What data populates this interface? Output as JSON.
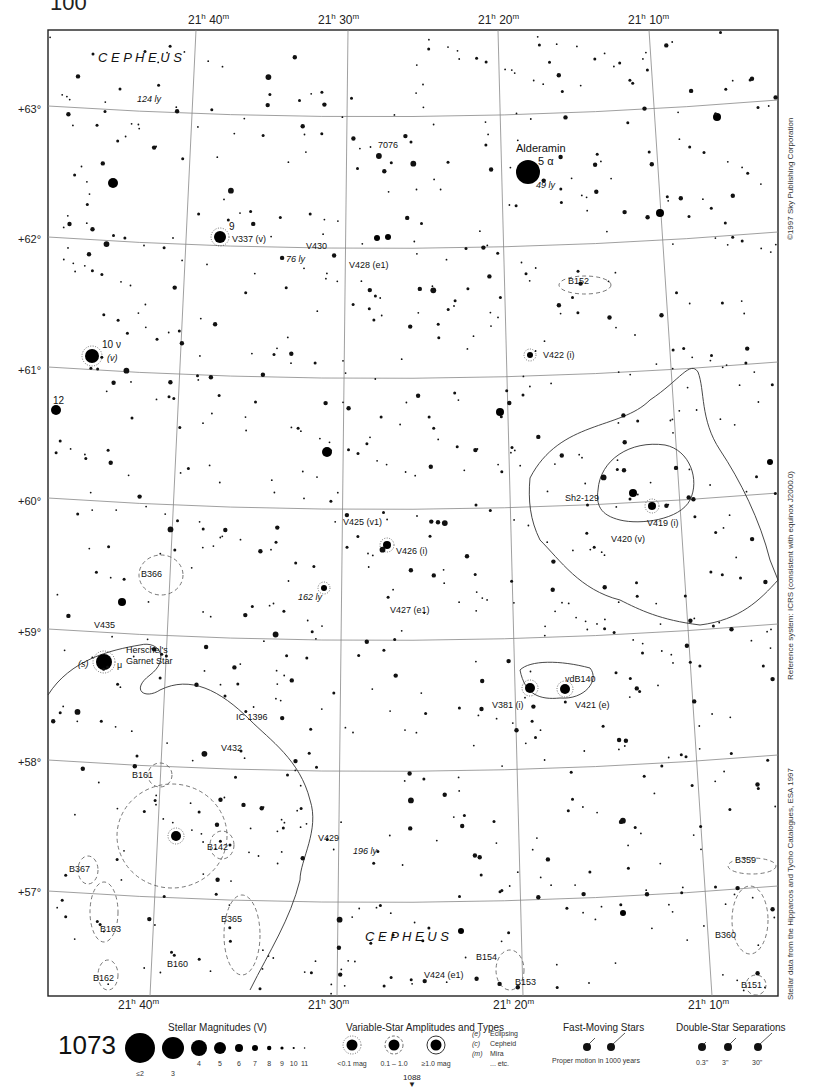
{
  "page": {
    "top_cut_number": "100",
    "page_number": "1073",
    "next_page_ref": "1088"
  },
  "chart": {
    "constellation_label": "C E P H E U S",
    "ra_labels_top": [
      {
        "h": "21",
        "m": "40",
        "x": 210
      },
      {
        "h": "21",
        "m": "30",
        "x": 340
      },
      {
        "h": "21",
        "m": "20",
        "x": 500
      },
      {
        "h": "21",
        "m": "10",
        "x": 650
      }
    ],
    "ra_labels_bottom": [
      {
        "h": "21",
        "m": "40",
        "x": 140
      },
      {
        "h": "21",
        "m": "30",
        "x": 330
      },
      {
        "h": "21",
        "m": "20",
        "x": 515
      },
      {
        "h": "21",
        "m": "10",
        "x": 710
      }
    ],
    "dec_labels": [
      {
        "text": "+63°",
        "y": 110
      },
      {
        "text": "+62°",
        "y": 240
      },
      {
        "text": "+61°",
        "y": 371
      },
      {
        "text": "+60°",
        "y": 502
      },
      {
        "text": "+59°",
        "y": 633
      },
      {
        "text": "+58°",
        "y": 763
      },
      {
        "text": "+57°",
        "y": 893
      }
    ],
    "side_texts": {
      "copyright": "©1997 Sky Publishing Corporation",
      "reference": "Reference system: ICRS (consistent with equinox J2000.0)",
      "stellar_data": "Stellar data from the Hipparcos and Tycho Catalogues, ESA 1997"
    },
    "labels": [
      {
        "text": "C E P H E U S",
        "x": 98,
        "y": 62,
        "size": 13,
        "italic": true
      },
      {
        "text": "124 ly",
        "x": 137,
        "y": 102,
        "size": 9,
        "italic": true
      },
      {
        "text": "7076",
        "x": 378,
        "y": 148,
        "size": 9
      },
      {
        "text": "Alderamin",
        "x": 516,
        "y": 152,
        "size": 11
      },
      {
        "text": "5 α",
        "x": 538,
        "y": 165,
        "size": 11
      },
      {
        "text": "49 ly",
        "x": 536,
        "y": 188,
        "size": 9,
        "italic": true
      },
      {
        "text": "9",
        "x": 229,
        "y": 230,
        "size": 10
      },
      {
        "text": "V337 (v)",
        "x": 232,
        "y": 242,
        "size": 9
      },
      {
        "text": "V430",
        "x": 306,
        "y": 249,
        "size": 9
      },
      {
        "text": "76 ly",
        "x": 286,
        "y": 262,
        "size": 9,
        "italic": true
      },
      {
        "text": "V428 (e1)",
        "x": 349,
        "y": 268,
        "size": 9
      },
      {
        "text": "B152",
        "x": 568,
        "y": 284,
        "size": 9
      },
      {
        "text": "10 ν",
        "x": 102,
        "y": 348,
        "size": 10
      },
      {
        "text": "(v)",
        "x": 107,
        "y": 361,
        "size": 9,
        "italic": true
      },
      {
        "text": "V422 (i)",
        "x": 543,
        "y": 358,
        "size": 9
      },
      {
        "text": "12",
        "x": 53,
        "y": 404,
        "size": 10
      },
      {
        "text": "Sh2-129",
        "x": 565,
        "y": 501,
        "size": 9
      },
      {
        "text": "V419 (i)",
        "x": 647,
        "y": 526,
        "size": 9
      },
      {
        "text": "V425 (v1)",
        "x": 343,
        "y": 525,
        "size": 9
      },
      {
        "text": "V426 (i)",
        "x": 396,
        "y": 554,
        "size": 9
      },
      {
        "text": "V420 (v)",
        "x": 611,
        "y": 542,
        "size": 9
      },
      {
        "text": "B366",
        "x": 141,
        "y": 577,
        "size": 9
      },
      {
        "text": "162 ly",
        "x": 298,
        "y": 600,
        "size": 9,
        "italic": true
      },
      {
        "text": "V427 (e1)",
        "x": 390,
        "y": 613,
        "size": 9
      },
      {
        "text": "V435",
        "x": 94,
        "y": 628,
        "size": 9
      },
      {
        "text": "Herschel's",
        "x": 126,
        "y": 653,
        "size": 9
      },
      {
        "text": "Garnet Star",
        "x": 126,
        "y": 664,
        "size": 9
      },
      {
        "text": "(s)",
        "x": 78,
        "y": 667,
        "size": 9,
        "italic": true
      },
      {
        "text": "μ",
        "x": 117,
        "y": 668,
        "size": 9
      },
      {
        "text": "vdB140",
        "x": 565,
        "y": 682,
        "size": 9
      },
      {
        "text": "V381 (i)",
        "x": 492,
        "y": 708,
        "size": 9
      },
      {
        "text": "V421 (e)",
        "x": 575,
        "y": 708,
        "size": 9
      },
      {
        "text": "IC 1396",
        "x": 236,
        "y": 720,
        "size": 9
      },
      {
        "text": "V432",
        "x": 221,
        "y": 751,
        "size": 9
      },
      {
        "text": "B161",
        "x": 132,
        "y": 778,
        "size": 9
      },
      {
        "text": "V429",
        "x": 318,
        "y": 841,
        "size": 9
      },
      {
        "text": "B142",
        "x": 207,
        "y": 850,
        "size": 9
      },
      {
        "text": "196 ly",
        "x": 353,
        "y": 854,
        "size": 9,
        "italic": true
      },
      {
        "text": "B359",
        "x": 735,
        "y": 863,
        "size": 9
      },
      {
        "text": "B367",
        "x": 69,
        "y": 872,
        "size": 9
      },
      {
        "text": "B365",
        "x": 221,
        "y": 922,
        "size": 9
      },
      {
        "text": "B163",
        "x": 100,
        "y": 932,
        "size": 9
      },
      {
        "text": "C E P H E U S",
        "x": 365,
        "y": 941,
        "size": 13,
        "italic": true
      },
      {
        "text": "B360",
        "x": 715,
        "y": 938,
        "size": 9
      },
      {
        "text": "B160",
        "x": 167,
        "y": 967,
        "size": 9
      },
      {
        "text": "B154",
        "x": 476,
        "y": 960,
        "size": 9
      },
      {
        "text": "V424 (e1)",
        "x": 424,
        "y": 978,
        "size": 9
      },
      {
        "text": "B162",
        "x": 93,
        "y": 981,
        "size": 9
      },
      {
        "text": "B153",
        "x": 515,
        "y": 985,
        "size": 9
      },
      {
        "text": "B151",
        "x": 741,
        "y": 988,
        "size": 9
      }
    ],
    "bright_stars": [
      {
        "x": 528,
        "y": 172,
        "r": 12
      },
      {
        "x": 92,
        "y": 356,
        "r": 7,
        "ring": true
      },
      {
        "x": 56,
        "y": 410,
        "r": 5
      },
      {
        "x": 104,
        "y": 662,
        "r": 8,
        "ring": true
      },
      {
        "x": 176,
        "y": 836,
        "r": 5,
        "ring": true
      },
      {
        "x": 220,
        "y": 237,
        "r": 6,
        "ring": true
      },
      {
        "x": 113,
        "y": 183,
        "r": 5
      },
      {
        "x": 327,
        "y": 452,
        "r": 5
      },
      {
        "x": 500,
        "y": 412,
        "r": 4
      },
      {
        "x": 660,
        "y": 213,
        "r": 4
      },
      {
        "x": 717,
        "y": 117,
        "r": 4
      },
      {
        "x": 770,
        "y": 462,
        "r": 3
      },
      {
        "x": 530,
        "y": 688,
        "r": 5,
        "ring": true
      },
      {
        "x": 565,
        "y": 689,
        "r": 5,
        "ring": true
      },
      {
        "x": 387,
        "y": 545,
        "r": 4,
        "ring": true
      },
      {
        "x": 633,
        "y": 493,
        "r": 4
      },
      {
        "x": 652,
        "y": 506,
        "r": 4,
        "ring": true
      },
      {
        "x": 122,
        "y": 602,
        "r": 4
      },
      {
        "x": 377,
        "y": 238,
        "r": 3
      },
      {
        "x": 388,
        "y": 237,
        "r": 3
      },
      {
        "x": 530,
        "y": 355,
        "r": 3,
        "ring": true
      },
      {
        "x": 324,
        "y": 588,
        "r": 3,
        "ring": true
      },
      {
        "x": 623,
        "y": 913,
        "r": 3
      },
      {
        "x": 461,
        "y": 931,
        "r": 3
      }
    ],
    "legend": {
      "magnitudes_title": "Stellar Magnitudes (V)",
      "magnitudes": [
        {
          "label": "≤2",
          "r": 15
        },
        {
          "label": "3",
          "r": 11
        },
        {
          "label": "4",
          "r": 8
        },
        {
          "label": "5",
          "r": 6
        },
        {
          "label": "6",
          "r": 4
        },
        {
          "label": "7",
          "r": 3
        },
        {
          "label": "8",
          "r": 2.2
        },
        {
          "label": "9",
          "r": 1.6
        },
        {
          "label": "10",
          "r": 1.1
        },
        {
          "label": "11",
          "r": 0.8
        }
      ],
      "variables_title": "Variable-Star Amplitudes and Types",
      "variables": [
        {
          "label": "<0.1 mag"
        },
        {
          "label": "0.1 – 1.0"
        },
        {
          "label": "≥1.0 mag"
        }
      ],
      "variable_types": [
        {
          "code": "(e)",
          "name": "Eclipsing"
        },
        {
          "code": "(c)",
          "name": "Cepheid"
        },
        {
          "code": "(m)",
          "name": "Mira"
        },
        {
          "code": "",
          "name": "... etc."
        }
      ],
      "fast_title": "Fast-Moving Stars",
      "fast_caption": "Proper motion in 1000 years",
      "double_title": "Double-Star Separations",
      "doubles": [
        "0.3\"",
        "3\"",
        "30\""
      ]
    }
  }
}
